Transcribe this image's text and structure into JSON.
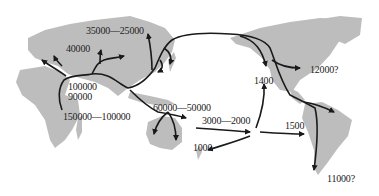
{
  "map": {
    "title": "",
    "land_color": "#bdbdbd",
    "route_color": "#1a1a1a",
    "background_color": "#ffffff",
    "labels": [
      {
        "id": "l1",
        "text": "35000—25000",
        "x": 86,
        "y": 31
      },
      {
        "id": "l2",
        "text": "40000",
        "x": 66,
        "y": 49
      },
      {
        "id": "l3",
        "text": "100000",
        "x": 68,
        "y": 86
      },
      {
        "id": "l4",
        "text": "90000",
        "x": 68,
        "y": 96
      },
      {
        "id": "l5",
        "text": "150000—100000",
        "x": 63,
        "y": 115
      },
      {
        "id": "l6",
        "text": "60000—50000",
        "x": 153,
        "y": 105
      },
      {
        "id": "l7",
        "text": "3000—2000",
        "x": 202,
        "y": 117
      },
      {
        "id": "l8",
        "text": "1000",
        "x": 193,
        "y": 145
      },
      {
        "id": "l9",
        "text": "1400",
        "x": 254,
        "y": 77
      },
      {
        "id": "l10",
        "text": "12000?",
        "x": 310,
        "y": 67
      },
      {
        "id": "l11",
        "text": "1500",
        "x": 285,
        "y": 124
      },
      {
        "id": "l12",
        "text": "11000?",
        "x": 327,
        "y": 173
      }
    ]
  }
}
